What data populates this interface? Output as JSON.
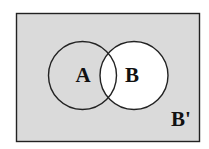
{
  "diagram": {
    "type": "venn",
    "universe": {
      "fill": "#dadada",
      "stroke": "#222222"
    },
    "sets": [
      {
        "name": "A",
        "label": "A",
        "fill": "transparent"
      },
      {
        "name": "B",
        "label": "B",
        "fill": "#ffffff"
      }
    ],
    "complement_label": "B'",
    "shaded_region": "B'"
  }
}
